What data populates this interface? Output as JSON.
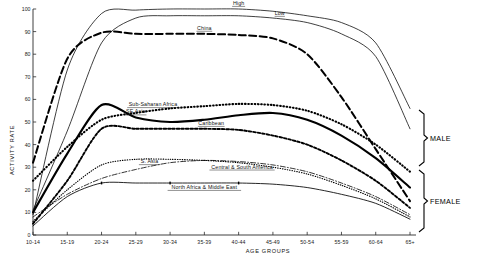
{
  "figure": {
    "title": "",
    "caption": "",
    "bracket_male_label": "MALE",
    "bracket_female_label": "FEMALE"
  },
  "axes": {
    "xlabel": "AGE GROUPS",
    "ylabel": "ACTIVITY RATE",
    "x_ticks": [
      "10-14",
      "15-19",
      "20-24",
      "25-29",
      "30-34",
      "35-39",
      "40-44",
      "45-49",
      "50-54",
      "55-59",
      "60-64",
      "65+"
    ],
    "y_ticks": [
      "0",
      "10",
      "20",
      "30",
      "40",
      "50",
      "60",
      "70",
      "80",
      "90",
      "100"
    ],
    "ylim": [
      0,
      100
    ],
    "grid": false
  },
  "chart_data": {
    "type": "line",
    "title": "",
    "xlabel": "AGE GROUPS",
    "ylabel": "ACTIVITY RATE",
    "ylim": [
      0,
      100
    ],
    "grid": false,
    "legend_position": "inline-labels",
    "categories": [
      "10-14",
      "15-19",
      "20-24",
      "25-29",
      "30-34",
      "35-39",
      "40-44",
      "45-49",
      "50-54",
      "55-59",
      "60-64",
      "65+"
    ],
    "series": [
      {
        "name": "High",
        "group": "MALE",
        "style": "thin-solid",
        "label_x_index": 6.0,
        "label_offset_y": -4,
        "values": [
          9,
          73,
          98,
          99.5,
          100,
          100,
          100,
          99,
          97,
          94,
          85,
          56
        ]
      },
      {
        "name": "Low",
        "group": "MALE",
        "style": "thin-solid",
        "label_x_index": 7.2,
        "label_offset_y": -4,
        "values": [
          11,
          46,
          85,
          96,
          97,
          97,
          97,
          96,
          94,
          89,
          79,
          47
        ]
      },
      {
        "name": "China",
        "group": "MALE",
        "style": "long-dash",
        "label_x_index": 5.0,
        "label_offset_y": -4,
        "values": [
          32,
          78,
          89.5,
          89,
          89,
          89,
          88.5,
          87,
          80,
          61,
          38,
          15
        ]
      },
      {
        "name": "Sub-Saharan Africa",
        "group": "MALE",
        "style": "dotted-heavy",
        "label_x_index": 3.5,
        "label_offset_y": -4.5,
        "values": [
          24,
          39,
          51,
          54,
          56,
          57,
          58,
          57.5,
          55,
          49,
          40,
          28
        ]
      },
      {
        "name": "SE Asia",
        "group": "MALE",
        "style": "thick-solid",
        "label_x_index": 3.0,
        "label_offset_y": -4,
        "values": [
          10,
          36,
          57.5,
          52,
          50,
          51,
          53,
          54,
          51,
          44,
          34,
          21
        ]
      },
      {
        "name": "Caribbean",
        "group": "FEMALE",
        "style": "dashed-heavy",
        "label_x_index": 5.2,
        "label_offset_y": -4,
        "values": [
          5,
          24,
          47,
          47,
          47,
          47,
          46.5,
          44,
          40,
          33,
          24,
          12
        ]
      },
      {
        "name": "Central & South America",
        "group": "FEMALE",
        "style": "dotted-fine",
        "label_x_index": 6.1,
        "label_offset_y": 5.5,
        "values": [
          6,
          20,
          31,
          33.5,
          33.5,
          33,
          32,
          30,
          27,
          22,
          16,
          8
        ]
      },
      {
        "name": "S. Asia",
        "group": "FEMALE",
        "style": "dash-dot",
        "label_x_index": 3.4,
        "label_offset_y": -3.5,
        "values": [
          8,
          18,
          25,
          29,
          32,
          33,
          32.5,
          31,
          28,
          23,
          17,
          9
        ]
      },
      {
        "name": "North Africa & Middle East",
        "group": "FEMALE",
        "style": "thin-marked",
        "label_x_index": 5.0,
        "label_offset_y": 6,
        "values": [
          4,
          17,
          23,
          23,
          23,
          23,
          23,
          22.5,
          21,
          18,
          14,
          7
        ]
      }
    ]
  }
}
